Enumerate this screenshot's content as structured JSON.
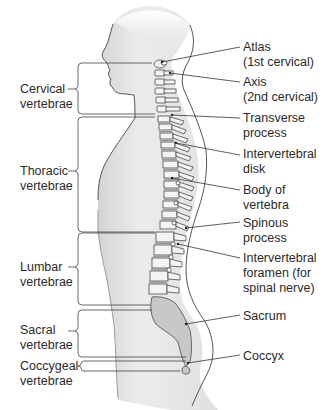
{
  "diagram": {
    "colors": {
      "body_fill": "#e6e6e6",
      "body_outline": "#555555",
      "bone_fill": "#f4f4f4",
      "bone_outline": "#333333",
      "disk_fill": "#9c9c9c",
      "sacrum_fill": "#c8c8c8",
      "line": "#333333",
      "text": "#2a2a2a"
    },
    "region_labels": [
      {
        "id": "cervical",
        "line1": "Cervical",
        "line2": "vertebrae"
      },
      {
        "id": "thoracic",
        "line1": "Thoracic",
        "line2": "vertebrae"
      },
      {
        "id": "lumbar",
        "line1": "Lumbar",
        "line2": "vertebrae"
      },
      {
        "id": "sacral",
        "line1": "Sacral",
        "line2": "vertebrae"
      },
      {
        "id": "coccygeal",
        "line1": "Coccygeal",
        "line2": "vertebrae"
      }
    ],
    "structure_labels": [
      {
        "id": "atlas",
        "line1": "Atlas",
        "line2": "(1st cervical)"
      },
      {
        "id": "axis",
        "line1": "Axis",
        "line2": "(2nd cervical)"
      },
      {
        "id": "transverse-process",
        "line1": "Transverse",
        "line2": "process"
      },
      {
        "id": "intervertebral-disk",
        "line1": "Intervertebral",
        "line2": "disk"
      },
      {
        "id": "body-of-vertebra",
        "line1": "Body of",
        "line2": "vertebra"
      },
      {
        "id": "spinous-process",
        "line1": "Spinous",
        "line2": "process"
      },
      {
        "id": "intervertebral-foramen",
        "line1": "Intervertebral",
        "line2": "foramen (for",
        "line3": "spinal nerve)"
      },
      {
        "id": "sacrum",
        "line1": "Sacrum"
      },
      {
        "id": "coccyx",
        "line1": "Coccyx"
      }
    ]
  }
}
